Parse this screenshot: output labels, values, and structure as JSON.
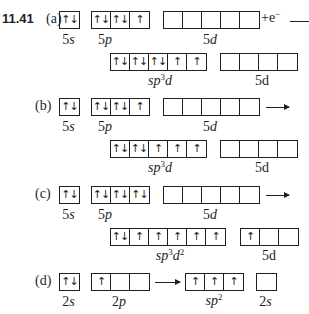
{
  "problem_number": "11.41",
  "parts": [
    {
      "label": "(a)",
      "ground": {
        "s": {
          "label_n": "5",
          "label_l": "s",
          "cells": [
            "↑↓"
          ]
        },
        "p": {
          "label_n": "5",
          "label_l": "p",
          "cells": [
            "↑↓",
            "↑↓",
            "↑"
          ]
        },
        "d": {
          "label_n": "5",
          "label_l": "d",
          "cells": [
            "",
            "",
            "",
            "",
            ""
          ]
        }
      },
      "suffix": "+e",
      "suffix_sup": "−",
      "hybrid": {
        "label": "sp",
        "sup": "3",
        "label_tail": "d",
        "cells": [
          "↑↓",
          "↑↓",
          "↑↓",
          "↑",
          "↑"
        ]
      },
      "remaining": {
        "label": "5d",
        "cells": [
          "",
          "",
          "",
          ""
        ]
      }
    },
    {
      "label": "(b)",
      "ground": {
        "s": {
          "label_n": "5",
          "label_l": "s",
          "cells": [
            "↑↓"
          ]
        },
        "p": {
          "label_n": "5",
          "label_l": "p",
          "cells": [
            "↑↓",
            "↑↓",
            "↑"
          ]
        },
        "d": {
          "label_n": "5",
          "label_l": "d",
          "cells": [
            "",
            "",
            "",
            "",
            ""
          ]
        }
      },
      "hybrid": {
        "label": "sp",
        "sup": "3",
        "label_tail": "d",
        "cells": [
          "↑↓",
          "↑↓",
          "↑",
          "↑",
          "↑"
        ]
      },
      "remaining": {
        "label": "5d",
        "cells": [
          "",
          "",
          "",
          ""
        ]
      }
    },
    {
      "label": "(c)",
      "ground": {
        "s": {
          "label_n": "5",
          "label_l": "s",
          "cells": [
            "↑↓"
          ]
        },
        "p": {
          "label_n": "5",
          "label_l": "p",
          "cells": [
            "↑↓",
            "↑↓",
            "↑↓"
          ]
        },
        "d": {
          "label_n": "5",
          "label_l": "d",
          "cells": [
            "",
            "",
            "",
            "",
            ""
          ]
        }
      },
      "hybrid": {
        "label": "sp",
        "sup": "3",
        "label_tail": "d",
        "sup2": "2",
        "cells": [
          "↑↓",
          "↑",
          "↑",
          "↑",
          "↑",
          "↑"
        ]
      },
      "remaining": {
        "label": "5d",
        "cells": [
          "↑",
          "",
          ""
        ]
      }
    },
    {
      "label": "(d)",
      "ground": {
        "s": {
          "label_n": "2",
          "label_l": "s",
          "cells": [
            "↑↓"
          ]
        },
        "p": {
          "label_n": "2",
          "label_l": "p",
          "cells": [
            "↑",
            "",
            ""
          ]
        }
      },
      "hybrid": {
        "label": "sp",
        "sup": "2",
        "cells": [
          "↑",
          "↑",
          "↑"
        ]
      },
      "remaining": {
        "label_n": "2",
        "label_l": "s",
        "cells": [
          ""
        ]
      }
    }
  ]
}
